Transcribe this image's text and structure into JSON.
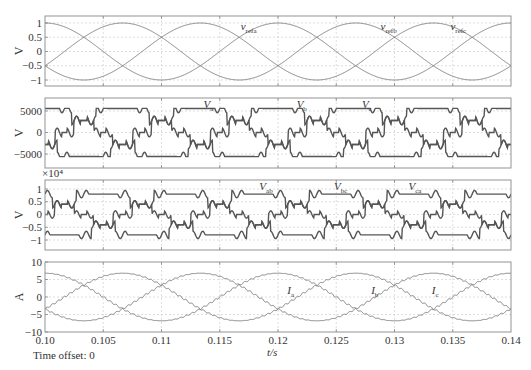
{
  "figure": {
    "time_offset_label": "Time offset: 0",
    "xlabel": "t/s",
    "x_ticks": [
      "0.10",
      "0.105",
      "0.11",
      "0.115",
      "0.12",
      "0.125",
      "0.13",
      "0.135",
      "0.14"
    ]
  },
  "chart_data": [
    {
      "type": "line",
      "title": "",
      "xlabel": "t/s",
      "ylabel": "V",
      "xlim": [
        0.1,
        0.14
      ],
      "ylim": [
        -1.2,
        1.2
      ],
      "y_ticks": [
        "1",
        "0.5",
        "0",
        "-0.5",
        "-1"
      ],
      "grid": true,
      "frequency_hz": 50,
      "series": [
        {
          "name": "v_refa",
          "label_main": "v",
          "label_sub": "refa",
          "amplitude": 1,
          "phase_deg": 0
        },
        {
          "name": "v_refb",
          "label_main": "v",
          "label_sub": "refb",
          "amplitude": 1,
          "phase_deg": -120
        },
        {
          "name": "v_refc",
          "label_main": "v",
          "label_sub": "refc",
          "amplitude": 1,
          "phase_deg": 120
        }
      ]
    },
    {
      "type": "line",
      "title": "",
      "xlabel": "t/s",
      "ylabel": "V",
      "xlim": [
        0.1,
        0.14
      ],
      "ylim": [
        -8000,
        8000
      ],
      "y_ticks": [
        "5000",
        "0",
        "-5000"
      ],
      "grid": true,
      "frequency_hz": 50,
      "series": [
        {
          "name": "V_a",
          "label_main": "V",
          "label_sub": "a",
          "amplitude": 6000,
          "phase_deg": 0,
          "style": "stepped"
        },
        {
          "name": "V_b",
          "label_main": "V",
          "label_sub": "b",
          "amplitude": 6000,
          "phase_deg": -120,
          "style": "stepped"
        },
        {
          "name": "V_c",
          "label_main": "V",
          "label_sub": "c",
          "amplitude": 6000,
          "phase_deg": 120,
          "style": "stepped"
        }
      ]
    },
    {
      "type": "line",
      "title": "",
      "xlabel": "t/s",
      "ylabel": "V",
      "y_scale_label": "×10⁴",
      "xlim": [
        0.1,
        0.14
      ],
      "ylim": [
        -1.4,
        1.4
      ],
      "y_ticks": [
        "1",
        "0.5",
        "0",
        "-0.5",
        "-1"
      ],
      "grid": true,
      "frequency_hz": 50,
      "series": [
        {
          "name": "V_ab",
          "label_main": "V",
          "label_sub": "ab",
          "amplitude": 0.8,
          "phase_deg": 30,
          "style": "stepped"
        },
        {
          "name": "V_bc",
          "label_main": "V",
          "label_sub": "bc",
          "amplitude": 0.8,
          "phase_deg": -90,
          "style": "stepped"
        },
        {
          "name": "V_ca",
          "label_main": "V",
          "label_sub": "ca",
          "amplitude": 0.8,
          "phase_deg": 150,
          "style": "stepped"
        }
      ]
    },
    {
      "type": "line",
      "title": "",
      "xlabel": "t/s",
      "ylabel": "A",
      "xlim": [
        0.1,
        0.14
      ],
      "ylim": [
        -10,
        10
      ],
      "y_ticks": [
        "10",
        "5",
        "0",
        "-5",
        "-10"
      ],
      "grid": true,
      "frequency_hz": 50,
      "series": [
        {
          "name": "I_a",
          "label_main": "I",
          "label_sub": "a",
          "amplitude": 6.8,
          "phase_deg": 0
        },
        {
          "name": "I_b",
          "label_main": "I",
          "label_sub": "b",
          "amplitude": 6.8,
          "phase_deg": -120
        },
        {
          "name": "I_c",
          "label_main": "I",
          "label_sub": "c",
          "amplitude": 6.8,
          "phase_deg": 120
        }
      ]
    }
  ]
}
